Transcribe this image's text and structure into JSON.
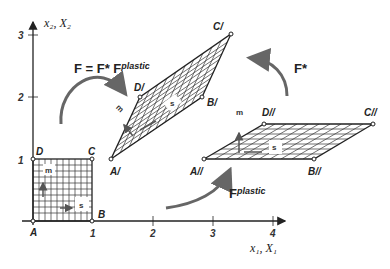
{
  "axes": {
    "x_label": "x₁, X₁",
    "y_label": "x₂, X₂",
    "x_ticks": [
      "1",
      "2",
      "3",
      "4"
    ],
    "y_ticks": [
      "1",
      "2",
      "3"
    ]
  },
  "reference_config": {
    "vertices": {
      "A": "A",
      "B": "B",
      "C": "C",
      "D": "D"
    },
    "slip_label": "s",
    "normal_label": "m"
  },
  "current_config": {
    "vertices": {
      "A": "A/",
      "B": "B/",
      "C": "C/",
      "D": "D/"
    },
    "slip_label": "s",
    "normal_label": "m"
  },
  "intermediate_config": {
    "vertices": {
      "A": "A//",
      "B": "B//",
      "C": "C//",
      "D": "D//"
    },
    "slip_label": "s",
    "normal_label": "m"
  },
  "arrows": {
    "total": {
      "label": "F = F* F",
      "superscript": "plastic"
    },
    "elastic": {
      "label": "F*"
    },
    "plastic": {
      "label": "F",
      "superscript": "plastic"
    }
  },
  "colors": {
    "line": "#222222",
    "arrow": "#666666",
    "grid": "#333333"
  }
}
